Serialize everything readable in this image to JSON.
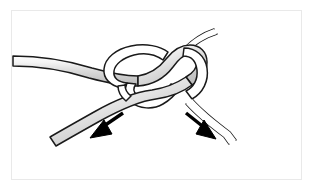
{
  "figure": {
    "kind": "line-art-illustration",
    "caption": "",
    "background_color": "#ffffff",
    "frame": {
      "visible": true,
      "border_color": "#e9e9e9",
      "border_width_px": 1,
      "x": 11,
      "y": 10,
      "width": 291,
      "height": 170
    }
  },
  "style": {
    "outline_color": "#1a1a1a",
    "outline_width_px": 1.6,
    "rope_shaded_fill": "#d9d9d9",
    "rope_shaded_highlight": "#f2f2f2",
    "rope_shaded_shadow": "#b5b5b5",
    "rope_plain_fill": "#ffffff",
    "arrow_color": "#000000"
  },
  "elements": {
    "rope_shaded": {
      "name": "shaded-rope",
      "description": "Thick gray-shaded rope entering from mid-left, through the knot, exiting toward lower-left",
      "color": "#d9d9d9"
    },
    "rope_plain": {
      "name": "plain-rope",
      "description": "White rope entering from upper-right, through the knot, exiting toward lower-right",
      "color": "#ffffff"
    },
    "knot_core": {
      "name": "knot-core",
      "description": "Interlocked loops at center where the two ropes pass through each other"
    }
  },
  "arrows": [
    {
      "id": "arrow-left",
      "label": "",
      "direction": "down-left",
      "points_to": "lower-left rope tail",
      "color": "#000000",
      "tip_x": 92,
      "tip_y": 137
    },
    {
      "id": "arrow-right",
      "label": "",
      "direction": "down-right",
      "points_to": "lower-right rope tail",
      "color": "#000000",
      "tip_x": 210,
      "tip_y": 137
    }
  ]
}
